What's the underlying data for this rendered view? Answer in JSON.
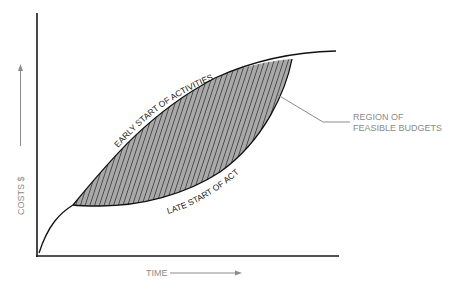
{
  "diagram": {
    "axes": {
      "y_label": "COSTS $",
      "x_label": "TIME"
    },
    "curves": {
      "early": {
        "label": "EARLY START OF ACTIVITIES"
      },
      "late": {
        "label": "LATE START OF ACTIVITIES"
      }
    },
    "region": {
      "label_line1": "REGION OF",
      "label_line2": "FEASIBLE BUDGETS"
    },
    "colors": {
      "axis": "#1a1a1a",
      "curve": "#111111",
      "hatch_fill": "#a9a9a9",
      "hatch_line": "#222222",
      "label_gray": "#8a8a8a",
      "leader": "#8c8c8c"
    }
  }
}
